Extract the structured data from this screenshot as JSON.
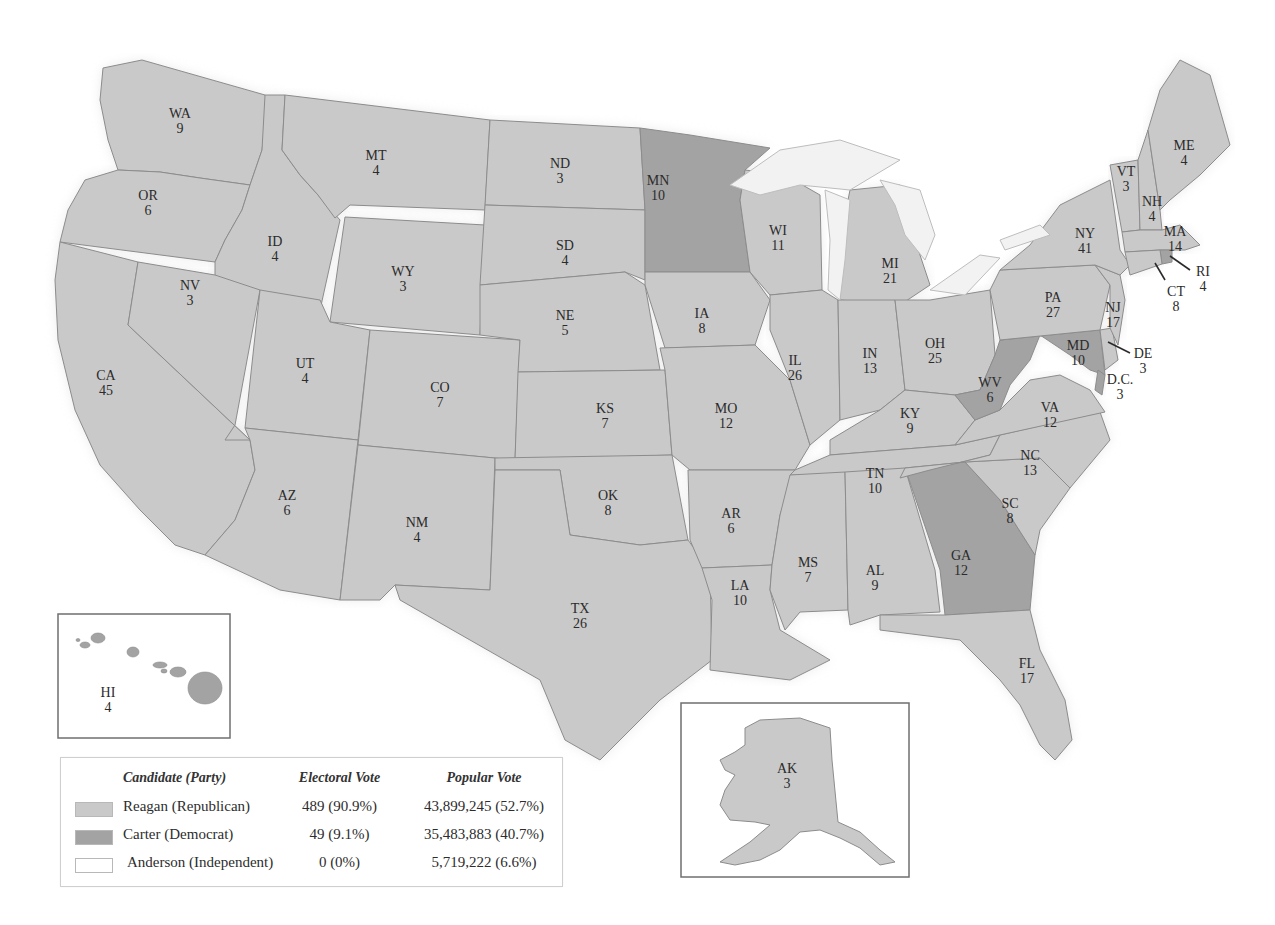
{
  "colors": {
    "reagan": "#c9c9c9",
    "carter": "#a3a3a3",
    "anderson": "#ffffff",
    "border": "#8c8c8c",
    "lakes": "#f2f2f2",
    "background": "#ffffff"
  },
  "legend": {
    "headers": {
      "candidate": "Candidate (Party)",
      "electoral": "Electoral Vote",
      "popular": "Popular Vote"
    },
    "rows": [
      {
        "candidate": "Reagan (Republican)",
        "electoral": "489 (90.9%)",
        "popular": "43,899,245 (52.7%)",
        "color_key": "reagan"
      },
      {
        "candidate": "Carter (Democrat)",
        "electoral": "49 (9.1%)",
        "popular": "35,483,883 (40.7%)",
        "color_key": "carter"
      },
      {
        "candidate": "Anderson (Independent)",
        "electoral": "0 (0%)",
        "popular": "5,719,222 (6.6%)",
        "color_key": "anderson"
      }
    ]
  },
  "states": [
    {
      "abbr": "WA",
      "ev": "9",
      "winner": "reagan",
      "lx": 180,
      "ly": 118,
      "pts": "103,68 142,60 265,95 268,100 262,150 250,185 200,178 160,172 118,170 108,140 100,100"
    },
    {
      "abbr": "OR",
      "ev": "6",
      "winner": "reagan",
      "lx": 148,
      "ly": 200,
      "pts": "118,170 160,172 200,178 250,185 242,210 225,240 215,262 60,242 68,210 85,180"
    },
    {
      "abbr": "CA",
      "ev": "45",
      "winner": "reagan",
      "lx": 106,
      "ly": 380,
      "pts": "60,242 138,262 128,325 250,440 255,470 235,520 205,555 175,545 140,510 100,465 75,410 58,340 55,280"
    },
    {
      "abbr": "ID",
      "ev": "4",
      "winner": "reagan",
      "lx": 275,
      "ly": 246,
      "pts": "265,95 285,95 282,150 300,175 318,195 340,220 320,310 215,293 215,262 225,240 242,210 250,185 262,150"
    },
    {
      "abbr": "NV",
      "ev": "3",
      "winner": "reagan",
      "lx": 190,
      "ly": 290,
      "pts": "138,262 215,275 260,290 235,425 225,440 250,440 128,325"
    },
    {
      "abbr": "MT",
      "ev": "4",
      "winner": "reagan",
      "lx": 376,
      "ly": 160,
      "pts": "285,95 490,120 485,210 350,205 335,218 318,195 300,175 282,150"
    },
    {
      "abbr": "WY",
      "ev": "3",
      "winner": "reagan",
      "lx": 403,
      "ly": 276,
      "pts": "345,217 485,225 480,335 330,322"
    },
    {
      "abbr": "UT",
      "ev": "4",
      "winner": "reagan",
      "lx": 305,
      "ly": 368,
      "pts": "260,290 320,300 330,322 370,330 358,440 245,428"
    },
    {
      "abbr": "AZ",
      "ev": "6",
      "winner": "reagan",
      "lx": 287,
      "ly": 500,
      "pts": "245,428 358,440 340,600 280,590 205,555 235,520 255,470 250,440"
    },
    {
      "abbr": "CO",
      "ev": "7",
      "winner": "reagan",
      "lx": 440,
      "ly": 392,
      "pts": "370,330 520,340 515,460 358,445"
    },
    {
      "abbr": "NM",
      "ev": "4",
      "winner": "reagan",
      "lx": 417,
      "ly": 527,
      "pts": "358,445 495,458 490,590 395,585 380,600 340,600"
    },
    {
      "abbr": "ND",
      "ev": "3",
      "winner": "reagan",
      "lx": 560,
      "ly": 168,
      "pts": "490,120 640,128 645,210 485,205"
    },
    {
      "abbr": "SD",
      "ev": "4",
      "winner": "reagan",
      "lx": 565,
      "ly": 250,
      "pts": "485,205 645,210 645,280 625,272 480,285"
    },
    {
      "abbr": "NE",
      "ev": "5",
      "winner": "reagan",
      "lx": 565,
      "ly": 320,
      "pts": "480,285 625,272 645,285 660,370 518,372 520,340 480,335"
    },
    {
      "abbr": "KS",
      "ev": "7",
      "winner": "reagan",
      "lx": 605,
      "ly": 413,
      "pts": "518,372 665,370 672,455 515,460"
    },
    {
      "abbr": "OK",
      "ev": "8",
      "winner": "reagan",
      "lx": 608,
      "ly": 500,
      "pts": "495,458 672,455 688,540 640,545 570,535 560,470 495,470"
    },
    {
      "abbr": "TX",
      "ev": "26",
      "winner": "reagan",
      "lx": 580,
      "ly": 613,
      "pts": "495,470 560,470 570,535 640,545 688,540 710,570 712,660 660,700 600,760 565,740 540,680 470,640 400,600 395,585 490,590"
    },
    {
      "abbr": "MN",
      "ev": "10",
      "winner": "carter",
      "lx": 658,
      "ly": 185,
      "pts": "640,128 690,135 770,148 745,170 740,200 750,272 645,272 645,210"
    },
    {
      "abbr": "IA",
      "ev": "8",
      "winner": "reagan",
      "lx": 702,
      "ly": 318,
      "pts": "645,272 750,272 770,300 755,345 665,348 645,285"
    },
    {
      "abbr": "MO",
      "ev": "12",
      "winner": "reagan",
      "lx": 726,
      "ly": 413,
      "pts": "660,348 755,345 790,380 810,445 795,470 690,470 672,455 665,370"
    },
    {
      "abbr": "AR",
      "ev": "6",
      "winner": "reagan",
      "lx": 731,
      "ly": 518,
      "pts": "688,470 795,470 780,515 772,565 702,568 690,540"
    },
    {
      "abbr": "LA",
      "ev": "10",
      "winner": "reagan",
      "lx": 740,
      "ly": 590,
      "pts": "702,568 772,565 770,590 780,630 830,660 790,680 710,670 712,600"
    },
    {
      "abbr": "WI",
      "ev": "11",
      "winner": "reagan",
      "lx": 778,
      "ly": 235,
      "pts": "745,170 785,175 820,195 822,290 770,295 750,272 740,200"
    },
    {
      "abbr": "IL",
      "ev": "26",
      "winner": "reagan",
      "lx": 795,
      "ly": 365,
      "pts": "770,295 822,290 838,300 840,420 810,445 790,380 770,330"
    },
    {
      "abbr": "MI",
      "ev": "21",
      "winner": "reagan",
      "lx": 890,
      "ly": 268,
      "pts": "850,190 900,185 915,240 930,285 900,305 840,300 838,250"
    },
    {
      "abbr": "IN",
      "ev": "13",
      "winner": "reagan",
      "lx": 870,
      "ly": 358,
      "pts": "838,300 895,300 905,390 880,410 840,420"
    },
    {
      "abbr": "OH",
      "ev": "25",
      "winner": "reagan",
      "lx": 935,
      "ly": 348,
      "pts": "895,300 930,300 990,290 995,355 980,390 955,395 905,390"
    },
    {
      "abbr": "KY",
      "ev": "9",
      "winner": "reagan",
      "lx": 910,
      "ly": 418,
      "pts": "830,440 880,410 905,390 955,395 975,420 955,445 830,455"
    },
    {
      "abbr": "TN",
      "ev": "10",
      "winner": "reagan",
      "lx": 875,
      "ly": 478,
      "pts": "795,470 830,455 955,445 1000,435 990,455 930,470 900,478 790,475"
    },
    {
      "abbr": "MS",
      "ev": "7",
      "winner": "reagan",
      "lx": 808,
      "ly": 567,
      "pts": "790,475 845,472 848,610 800,612 785,630 770,590 772,565 780,515"
    },
    {
      "abbr": "AL",
      "ev": "9",
      "winner": "reagan",
      "lx": 875,
      "ly": 575,
      "pts": "845,472 905,468 935,570 940,612 880,615 850,625 848,610"
    },
    {
      "abbr": "GA",
      "ev": "12",
      "winner": "carter",
      "lx": 961,
      "ly": 560,
      "pts": "905,468 965,462 1000,500 1035,555 1030,610 945,615 940,570"
    },
    {
      "abbr": "FL",
      "ev": "17",
      "winner": "reagan",
      "lx": 1027,
      "ly": 668,
      "pts": "880,615 945,615 1030,610 1040,650 1065,700 1072,740 1055,760 1040,745 1020,705 1000,680 960,640 920,635 880,630"
    },
    {
      "abbr": "SC",
      "ev": "8",
      "winner": "reagan",
      "lx": 1010,
      "ly": 508,
      "pts": "965,462 1040,458 1070,488 1040,530 1035,555 1000,500"
    },
    {
      "abbr": "NC",
      "ev": "13",
      "winner": "reagan",
      "lx": 1030,
      "ly": 460,
      "pts": "930,470 990,455 1000,435 1100,412 1110,440 1070,488 1040,458 965,462 905,468 900,478"
    },
    {
      "abbr": "VA",
      "ev": "12",
      "winner": "reagan",
      "lx": 1050,
      "ly": 412,
      "pts": "955,445 975,420 1000,410 1030,380 1060,375 1090,390 1105,412 1000,435"
    },
    {
      "abbr": "WV",
      "ev": "6",
      "winner": "carter",
      "lx": 990,
      "ly": 387,
      "pts": "955,395 980,390 995,355 1000,340 1040,335 1030,360 1010,385 1000,410 975,420"
    },
    {
      "abbr": "MD",
      "ev": "10",
      "winner": "carter",
      "lx": 1078,
      "ly": 350,
      "pts": "1000,340 1100,330 1105,375 1090,370 1070,355 1040,335"
    },
    {
      "abbr": "DE",
      "ev": "3",
      "winner": "reagan",
      "lx": 1143,
      "ly": 358,
      "pts": "1100,330 1112,328 1118,360 1105,370"
    },
    {
      "abbr": "DC",
      "label": "D.C.",
      "ev": "3",
      "winner": "carter",
      "lx": 1120,
      "ly": 384,
      "pts": "1098,370 1105,375 1102,395 1095,390"
    },
    {
      "abbr": "PA",
      "ev": "27",
      "winner": "reagan",
      "lx": 1053,
      "ly": 302,
      "pts": "990,290 1000,270 1095,265 1110,285 1100,330 1000,340"
    },
    {
      "abbr": "NJ",
      "ev": "17",
      "winner": "reagan",
      "lx": 1113,
      "ly": 312,
      "pts": "1095,265 1120,275 1125,300 1118,345 1110,328 1110,285"
    },
    {
      "abbr": "NY",
      "ev": "41",
      "winner": "reagan",
      "lx": 1085,
      "ly": 238,
      "pts": "1000,270 1030,245 1060,205 1110,180 1120,250 1130,265 1120,275 1095,265"
    },
    {
      "abbr": "VT",
      "ev": "3",
      "winner": "reagan",
      "lx": 1126,
      "ly": 176,
      "pts": "1110,165 1138,160 1140,230 1122,232"
    },
    {
      "abbr": "NH",
      "ev": "4",
      "winner": "reagan",
      "lx": 1152,
      "ly": 206,
      "pts": "1138,160 1148,130 1160,210 1162,230 1140,230"
    },
    {
      "abbr": "ME",
      "ev": "4",
      "winner": "reagan",
      "lx": 1184,
      "ly": 150,
      "pts": "1148,130 1160,90 1180,60 1210,75 1230,145 1200,175 1170,200 1160,210"
    },
    {
      "abbr": "MA",
      "ev": "14",
      "winner": "reagan",
      "lx": 1175,
      "ly": 236,
      "pts": "1122,232 1140,230 1162,230 1180,225 1200,245 1185,250 1160,250 1125,252"
    },
    {
      "abbr": "RI",
      "ev": "4",
      "winner": "carter",
      "lx": 1203,
      "ly": 276,
      "pts": "1160,250 1172,250 1172,262 1162,264"
    },
    {
      "abbr": "CT",
      "ev": "8",
      "winner": "reagan",
      "lx": 1176,
      "ly": 296,
      "pts": "1125,252 1160,250 1162,264 1130,275"
    }
  ],
  "lakes": [
    {
      "name": "Lake Superior",
      "pts": "730,185 780,150 840,140 900,160 850,190 800,185 760,195"
    },
    {
      "name": "Lake Michigan",
      "pts": "825,190 850,200 845,260 840,300 828,290 830,240"
    },
    {
      "name": "Lake Huron",
      "pts": "880,180 920,190 935,235 925,260 905,235 895,205"
    },
    {
      "name": "Lake Erie",
      "pts": "930,290 980,255 1000,258 965,295"
    },
    {
      "name": "Lake Ontario",
      "pts": "1000,240 1040,225 1050,235 1005,250"
    }
  ],
  "insets": {
    "hawaii": {
      "abbr": "HI",
      "ev": "4",
      "winner": "carter",
      "box": {
        "x": 58,
        "y": 614,
        "w": 172,
        "h": 124
      },
      "lx": 108,
      "ly": 697,
      "islands": [
        {
          "cx": 78,
          "cy": 640,
          "rx": 2,
          "ry": 1.5
        },
        {
          "cx": 85,
          "cy": 645,
          "rx": 5,
          "ry": 3
        },
        {
          "cx": 98,
          "cy": 638,
          "rx": 7,
          "ry": 5
        },
        {
          "cx": 133,
          "cy": 652,
          "rx": 6,
          "ry": 5
        },
        {
          "cx": 160,
          "cy": 665,
          "rx": 7,
          "ry": 3
        },
        {
          "cx": 164,
          "cy": 671,
          "rx": 3,
          "ry": 2
        },
        {
          "cx": 178,
          "cy": 672,
          "rx": 8,
          "ry": 5
        },
        {
          "cx": 205,
          "cy": 688,
          "rx": 17,
          "ry": 16
        }
      ]
    },
    "alaska": {
      "abbr": "AK",
      "ev": "3",
      "winner": "reagan",
      "box": {
        "x": 681,
        "y": 703,
        "w": 228,
        "h": 174
      },
      "lx": 787,
      "ly": 773,
      "pts": "745,728 760,720 800,718 830,728 832,760 838,822 860,832 880,850 895,862 880,865 860,848 840,838 820,830 800,832 780,850 760,860 735,865 720,862 750,842 770,825 755,822 730,820 720,805 725,790 735,775 725,770 720,760 735,752 745,745"
    }
  },
  "leaders": [
    {
      "for": "RI",
      "x1": 1170,
      "y1": 256,
      "x2": 1190,
      "y2": 270
    },
    {
      "for": "CT",
      "x1": 1155,
      "y1": 263,
      "x2": 1165,
      "y2": 280
    },
    {
      "for": "DE",
      "x1": 1108,
      "y1": 342,
      "x2": 1130,
      "y2": 353
    }
  ]
}
